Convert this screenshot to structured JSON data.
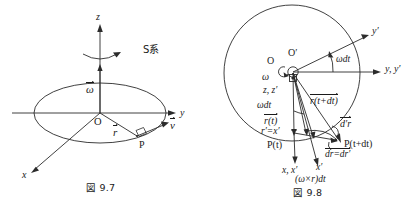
{
  "figure_left": {
    "name": "fig-9-7",
    "caption": "図 9.7",
    "frame_label": "S系",
    "axes": [
      {
        "key": "z",
        "label": "z"
      },
      {
        "key": "y",
        "label": "y"
      },
      {
        "key": "x",
        "label": "x"
      }
    ],
    "origin_label": "O",
    "point_label": "P",
    "vectors": [
      {
        "key": "omega",
        "label": "ω",
        "overarrow": true
      },
      {
        "key": "r",
        "label": "r",
        "overarrow": true
      },
      {
        "key": "v",
        "label": "v",
        "overarrow": true
      }
    ],
    "annotations": {
      "right_angle": "right-angle-marker",
      "rotation": "rotation-arc-arrow",
      "orbit": "circular-orbit-ellipse"
    }
  },
  "figure_right": {
    "name": "fig-9-8",
    "caption": "図 9.8",
    "origin_fixed": "O",
    "origin_rotating": "O′",
    "axes": [
      {
        "key": "y-prime",
        "label": "y′"
      },
      {
        "key": "y-yprime",
        "label": "y, y′"
      },
      {
        "key": "z-zprime",
        "label": "z, z′"
      },
      {
        "key": "x-xprime",
        "label": "x, x′"
      },
      {
        "key": "x-prime-rot",
        "label": "x′"
      }
    ],
    "labels": {
      "omega": "ω",
      "omega_dt_top": "ωdt",
      "omega_dt_left": "ωdt",
      "r_t": "r(t)",
      "r_t_dt": "r(t+dt)",
      "r_prime_eq_x_prime": "r′=x′",
      "d_prime_r": "d′r",
      "dr_eq_dr_prime": "dr=dr′",
      "omega_cross_r_dt": "(ω×r)dt",
      "p_t": "P(t)",
      "p_t_dt": "P(t+dt)"
    }
  },
  "style": {
    "ink": "#1a1a1a",
    "line": "#2b2b2b",
    "background": "#ffffff"
  }
}
